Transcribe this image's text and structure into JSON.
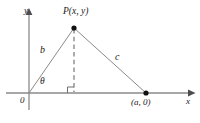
{
  "figure": {
    "kind": "geometry-diagram",
    "colors": {
      "line": "#8a8a8a",
      "dashed": "#8a8a8a",
      "axis": "#8a8a8a",
      "point": "#111111",
      "text": "#1a1a1a",
      "background": "#ffffff"
    },
    "axes": {
      "y_label": "y",
      "x_label": "x",
      "origin_label": "0",
      "x_axis_y_px": 93,
      "y_axis_x_px": 29,
      "x_axis_arrow_x_px": 190,
      "y_axis_arrow_y_px": 13
    },
    "points": [
      {
        "name": "P",
        "label": "P(x, y)",
        "x_px": 74,
        "y_px": 28,
        "marker": "filled-dot"
      },
      {
        "name": "A",
        "label": "(a, 0)",
        "x_px": 146,
        "y_px": 93,
        "marker": "filled-dot"
      },
      {
        "name": "O",
        "label": "0",
        "x_px": 29,
        "y_px": 93,
        "marker": "none"
      }
    ],
    "segments": [
      {
        "name": "b",
        "label": "b",
        "from": "O",
        "to": "P",
        "style": "solid"
      },
      {
        "name": "c",
        "label": "c",
        "from": "P",
        "to": "A",
        "style": "solid"
      },
      {
        "name": "height",
        "label": "",
        "from": "P",
        "to": "foot",
        "style": "dashed"
      }
    ],
    "angles": [
      {
        "name": "theta",
        "label": "θ",
        "at": "O",
        "between": [
          "x-axis",
          "b"
        ]
      },
      {
        "name": "right-angle",
        "label": "",
        "at": "foot",
        "marker": "square"
      }
    ],
    "foot": {
      "x_px": 74,
      "y_px": 93
    }
  }
}
